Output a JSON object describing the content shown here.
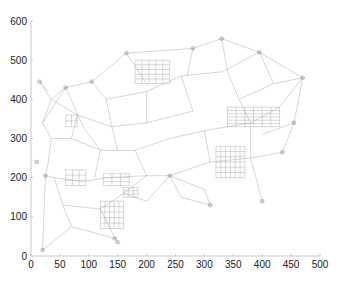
{
  "chart_data": {
    "type": "network",
    "title": "",
    "xlabel": "",
    "ylabel": "",
    "xlim": [
      0,
      500
    ],
    "ylim": [
      0,
      600
    ],
    "xticks": [
      0,
      50,
      100,
      150,
      200,
      250,
      300,
      350,
      400,
      450,
      500
    ],
    "yticks": [
      0,
      100,
      200,
      300,
      400,
      500,
      600
    ],
    "grid": false,
    "legend": null,
    "highlighted_nodes": [
      {
        "x": 15,
        "y": 445
      },
      {
        "x": 60,
        "y": 430
      },
      {
        "x": 105,
        "y": 445
      },
      {
        "x": 165,
        "y": 518
      },
      {
        "x": 280,
        "y": 530
      },
      {
        "x": 330,
        "y": 555
      },
      {
        "x": 395,
        "y": 520
      },
      {
        "x": 470,
        "y": 455
      },
      {
        "x": 455,
        "y": 340
      },
      {
        "x": 435,
        "y": 265
      },
      {
        "x": 400,
        "y": 140
      },
      {
        "x": 10,
        "y": 240
      },
      {
        "x": 25,
        "y": 205
      },
      {
        "x": 20,
        "y": 15
      },
      {
        "x": 145,
        "y": 45
      },
      {
        "x": 150,
        "y": 35
      },
      {
        "x": 240,
        "y": 205
      },
      {
        "x": 310,
        "y": 130
      }
    ],
    "edges": [
      [
        15,
        445,
        35,
        400
      ],
      [
        35,
        400,
        60,
        430
      ],
      [
        60,
        430,
        105,
        445
      ],
      [
        105,
        445,
        165,
        518
      ],
      [
        165,
        518,
        280,
        530
      ],
      [
        280,
        530,
        330,
        555
      ],
      [
        330,
        555,
        395,
        520
      ],
      [
        395,
        520,
        470,
        455
      ],
      [
        470,
        455,
        455,
        340
      ],
      [
        455,
        340,
        435,
        265
      ],
      [
        455,
        340,
        400,
        310
      ],
      [
        35,
        400,
        20,
        340
      ],
      [
        20,
        340,
        35,
        300
      ],
      [
        35,
        300,
        30,
        240
      ],
      [
        30,
        240,
        25,
        205
      ],
      [
        25,
        205,
        20,
        15
      ],
      [
        20,
        15,
        70,
        75
      ],
      [
        70,
        75,
        145,
        45
      ],
      [
        145,
        45,
        150,
        35
      ],
      [
        70,
        75,
        55,
        130
      ],
      [
        55,
        130,
        40,
        200
      ],
      [
        40,
        200,
        25,
        205
      ],
      [
        35,
        400,
        80,
        360
      ],
      [
        60,
        430,
        90,
        330
      ],
      [
        80,
        360,
        140,
        330
      ],
      [
        140,
        330,
        200,
        340
      ],
      [
        200,
        340,
        280,
        370
      ],
      [
        105,
        445,
        130,
        400
      ],
      [
        130,
        400,
        200,
        420
      ],
      [
        200,
        420,
        260,
        460
      ],
      [
        260,
        460,
        330,
        470
      ],
      [
        330,
        470,
        395,
        520
      ],
      [
        165,
        518,
        200,
        440
      ],
      [
        280,
        530,
        270,
        460
      ],
      [
        330,
        555,
        340,
        470
      ],
      [
        395,
        520,
        420,
        440
      ],
      [
        420,
        440,
        470,
        455
      ],
      [
        90,
        330,
        120,
        270
      ],
      [
        120,
        270,
        180,
        270
      ],
      [
        180,
        270,
        240,
        300
      ],
      [
        240,
        300,
        300,
        320
      ],
      [
        300,
        320,
        380,
        340
      ],
      [
        380,
        340,
        430,
        380
      ],
      [
        430,
        380,
        470,
        455
      ],
      [
        40,
        200,
        90,
        190
      ],
      [
        90,
        190,
        130,
        200
      ],
      [
        130,
        200,
        200,
        205
      ],
      [
        200,
        205,
        240,
        205
      ],
      [
        240,
        205,
        310,
        240
      ],
      [
        310,
        240,
        380,
        250
      ],
      [
        380,
        250,
        435,
        265
      ],
      [
        240,
        205,
        300,
        170
      ],
      [
        300,
        170,
        310,
        130
      ],
      [
        240,
        205,
        260,
        150
      ],
      [
        260,
        150,
        310,
        130
      ],
      [
        180,
        270,
        200,
        205
      ],
      [
        120,
        270,
        110,
        200
      ],
      [
        300,
        320,
        310,
        240
      ],
      [
        380,
        340,
        380,
        250
      ],
      [
        380,
        250,
        400,
        140
      ],
      [
        35,
        300,
        70,
        300
      ],
      [
        70,
        300,
        120,
        270
      ],
      [
        55,
        130,
        120,
        120
      ],
      [
        120,
        120,
        145,
        45
      ],
      [
        120,
        120,
        160,
        160
      ],
      [
        160,
        160,
        200,
        205
      ],
      [
        160,
        160,
        200,
        140
      ],
      [
        200,
        140,
        240,
        205
      ],
      [
        80,
        360,
        70,
        300
      ],
      [
        140,
        330,
        150,
        270
      ],
      [
        200,
        420,
        200,
        340
      ],
      [
        260,
        460,
        280,
        370
      ],
      [
        340,
        470,
        360,
        400
      ],
      [
        360,
        400,
        420,
        440
      ],
      [
        360,
        400,
        380,
        340
      ],
      [
        60,
        430,
        20,
        340
      ],
      [
        130,
        400,
        140,
        330
      ],
      [
        15,
        445,
        30,
        420
      ]
    ],
    "grids": [
      {
        "x0": 180,
        "y0": 440,
        "x1": 240,
        "y1": 500,
        "n": 5
      },
      {
        "x0": 60,
        "y0": 180,
        "x1": 95,
        "y1": 220,
        "n": 3
      },
      {
        "x0": 125,
        "y0": 180,
        "x1": 170,
        "y1": 210,
        "n": 3
      },
      {
        "x0": 120,
        "y0": 70,
        "x1": 160,
        "y1": 140,
        "n": 5
      },
      {
        "x0": 160,
        "y0": 150,
        "x1": 185,
        "y1": 175,
        "n": 3
      },
      {
        "x0": 320,
        "y0": 200,
        "x1": 370,
        "y1": 280,
        "n": 6
      },
      {
        "x0": 340,
        "y0": 330,
        "x1": 430,
        "y1": 380,
        "n": 6
      },
      {
        "x0": 60,
        "y0": 330,
        "x1": 80,
        "y1": 360,
        "n": 2
      }
    ]
  },
  "axis_labels": {
    "x": [
      "0",
      "50",
      "100",
      "150",
      "200",
      "250",
      "300",
      "350",
      "400",
      "450",
      "500"
    ],
    "y": [
      "0",
      "100",
      "200",
      "300",
      "400",
      "500",
      "600"
    ]
  }
}
